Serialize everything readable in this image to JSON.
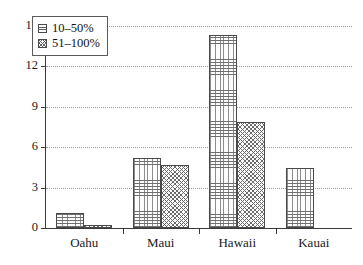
{
  "chart_data": {
    "type": "bar",
    "title": "",
    "xlabel": "",
    "ylabel": "",
    "categories": [
      "Oahu",
      "Maui",
      "Hawaii",
      "Kauai"
    ],
    "ylim": [
      0,
      15
    ],
    "yticks": [
      0,
      3,
      6,
      9,
      12,
      15
    ],
    "ytick_labels": [
      "0",
      "3",
      "6",
      "9",
      "12",
      "15"
    ],
    "grid": "horizontal-dotted",
    "legend_position": "top-left-inside",
    "series": [
      {
        "name": "10–50%",
        "pattern": "horizontal-line-hatch",
        "color": "#6f6f6f",
        "values": [
          1.1,
          5.2,
          14.3,
          4.45
        ]
      },
      {
        "name": "51–100%",
        "pattern": "cross-hatch-stipple",
        "color": "#6b6b6b",
        "values": [
          0.2,
          4.65,
          7.9,
          0
        ]
      }
    ]
  },
  "axes": {
    "axis_color": "#3a3a3a",
    "gridline_color": "#9a9a9a"
  }
}
